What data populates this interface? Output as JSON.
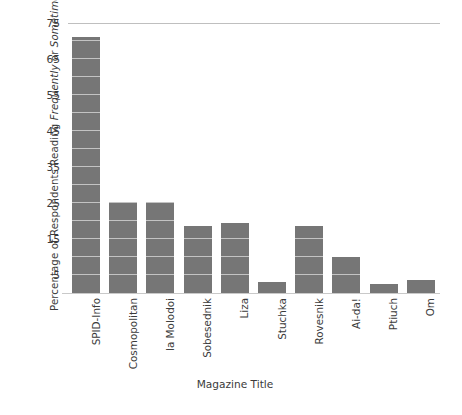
{
  "chart_data": {
    "type": "bar",
    "title": "",
    "xlabel": "Magazine Title",
    "ylabel_plain": "Percentage of Respondents Reading Frequently or Sometimes",
    "ylabel_parts": [
      {
        "text": "Percentage of Respondents Reading ",
        "italic": false
      },
      {
        "text": "Frequently",
        "italic": true
      },
      {
        "text": " or ",
        "italic": false
      },
      {
        "text": "Sometimes",
        "italic": true
      }
    ],
    "categories": [
      "SPID-Info",
      "Cosmopolitan",
      "la Molodoi",
      "Sobesednik",
      "Liza",
      "Stuchka",
      "Rovesnik",
      "Ai-da!",
      "Ptiuch",
      "Om"
    ],
    "values": [
      71,
      25.3,
      25.3,
      18.5,
      19.5,
      3,
      18.5,
      10,
      2.5,
      3.5
    ],
    "ylim": [
      0,
      75
    ],
    "yticks": [
      75,
      65,
      55,
      45,
      35,
      25,
      15,
      5
    ],
    "ytick_labels": [
      "75",
      "65",
      "55",
      "45",
      "35",
      "25",
      "15",
      "5"
    ],
    "minor_gridline_step": 5,
    "grid": "minor-horizontal-over-bars",
    "legend": "none",
    "bar_color": "#767676",
    "gridline_color": "#c3c3c3",
    "axis_color": "#c9c9c9",
    "background_color": "#ffffff",
    "text_color": "#3b3b3b"
  }
}
